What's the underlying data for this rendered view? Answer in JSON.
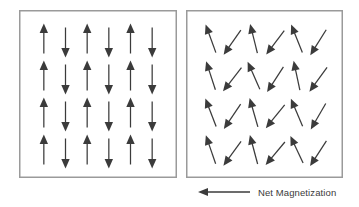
{
  "figure": {
    "background_color": "#ffffff",
    "arrow_color": "#3b3b3b",
    "border_color": "#9a9a9a"
  },
  "panels": [
    {
      "id": "ordered-box",
      "name": "antiferromagnetic-ordered-panel",
      "description": "Left panel: vertical spins alternating up and down",
      "columns": 6,
      "rows": 4,
      "box": {
        "x": 19,
        "y": 10,
        "width": 158,
        "height": 168
      },
      "arrow_length": 30,
      "arrows": [
        {
          "col": 0,
          "row": 0,
          "direction": "up",
          "angle_deg": 0
        },
        {
          "col": 1,
          "row": 0,
          "direction": "down",
          "angle_deg": 180
        },
        {
          "col": 2,
          "row": 0,
          "direction": "up",
          "angle_deg": 0
        },
        {
          "col": 3,
          "row": 0,
          "direction": "down",
          "angle_deg": 180
        },
        {
          "col": 4,
          "row": 0,
          "direction": "up",
          "angle_deg": 0
        },
        {
          "col": 5,
          "row": 0,
          "direction": "down",
          "angle_deg": 180
        },
        {
          "col": 0,
          "row": 1,
          "direction": "up",
          "angle_deg": 0
        },
        {
          "col": 1,
          "row": 1,
          "direction": "down",
          "angle_deg": 180
        },
        {
          "col": 2,
          "row": 1,
          "direction": "up",
          "angle_deg": 0
        },
        {
          "col": 3,
          "row": 1,
          "direction": "down",
          "angle_deg": 180
        },
        {
          "col": 4,
          "row": 1,
          "direction": "up",
          "angle_deg": 0
        },
        {
          "col": 5,
          "row": 1,
          "direction": "down",
          "angle_deg": 180
        },
        {
          "col": 0,
          "row": 2,
          "direction": "up",
          "angle_deg": 0
        },
        {
          "col": 1,
          "row": 2,
          "direction": "down",
          "angle_deg": 180
        },
        {
          "col": 2,
          "row": 2,
          "direction": "up",
          "angle_deg": 0
        },
        {
          "col": 3,
          "row": 2,
          "direction": "down",
          "angle_deg": 180
        },
        {
          "col": 4,
          "row": 2,
          "direction": "up",
          "angle_deg": 0
        },
        {
          "col": 5,
          "row": 2,
          "direction": "down",
          "angle_deg": 180
        },
        {
          "col": 0,
          "row": 3,
          "direction": "up",
          "angle_deg": 0
        },
        {
          "col": 1,
          "row": 3,
          "direction": "down",
          "angle_deg": 180
        },
        {
          "col": 2,
          "row": 3,
          "direction": "up",
          "angle_deg": 0
        },
        {
          "col": 3,
          "row": 3,
          "direction": "down",
          "angle_deg": 180
        },
        {
          "col": 4,
          "row": 3,
          "direction": "up",
          "angle_deg": 0
        },
        {
          "col": 5,
          "row": 3,
          "direction": "down",
          "angle_deg": 180
        }
      ]
    },
    {
      "id": "disordered-box",
      "name": "canted-spin-panel",
      "description": "Right panel: spins canted, up-arrows tilted left, down-arrows tilted right",
      "columns": 6,
      "rows": 4,
      "box": {
        "x": 186,
        "y": 10,
        "width": 157,
        "height": 168
      },
      "arrow_length": 30,
      "arrows": [
        {
          "col": 0,
          "row": 0,
          "direction": "up",
          "angle_deg": -20
        },
        {
          "col": 1,
          "row": 0,
          "direction": "down",
          "angle_deg": 215
        },
        {
          "col": 2,
          "row": 0,
          "direction": "up",
          "angle_deg": -14
        },
        {
          "col": 3,
          "row": 0,
          "direction": "down",
          "angle_deg": 217
        },
        {
          "col": 4,
          "row": 0,
          "direction": "up",
          "angle_deg": -22
        },
        {
          "col": 5,
          "row": 0,
          "direction": "down",
          "angle_deg": 212
        },
        {
          "col": 0,
          "row": 1,
          "direction": "up",
          "angle_deg": -18
        },
        {
          "col": 1,
          "row": 1,
          "direction": "down",
          "angle_deg": 218
        },
        {
          "col": 2,
          "row": 1,
          "direction": "up",
          "angle_deg": -24
        },
        {
          "col": 3,
          "row": 1,
          "direction": "down",
          "angle_deg": 213
        },
        {
          "col": 4,
          "row": 1,
          "direction": "up",
          "angle_deg": -12
        },
        {
          "col": 5,
          "row": 1,
          "direction": "down",
          "angle_deg": 216
        },
        {
          "col": 0,
          "row": 2,
          "direction": "up",
          "angle_deg": -21
        },
        {
          "col": 1,
          "row": 2,
          "direction": "down",
          "angle_deg": 214
        },
        {
          "col": 2,
          "row": 2,
          "direction": "up",
          "angle_deg": -16
        },
        {
          "col": 3,
          "row": 2,
          "direction": "down",
          "angle_deg": 219
        },
        {
          "col": 4,
          "row": 2,
          "direction": "up",
          "angle_deg": -23
        },
        {
          "col": 5,
          "row": 2,
          "direction": "down",
          "angle_deg": 210
        },
        {
          "col": 0,
          "row": 3,
          "direction": "up",
          "angle_deg": -19
        },
        {
          "col": 1,
          "row": 3,
          "direction": "down",
          "angle_deg": 216
        },
        {
          "col": 2,
          "row": 3,
          "direction": "up",
          "angle_deg": -15
        },
        {
          "col": 3,
          "row": 3,
          "direction": "down",
          "angle_deg": 220
        },
        {
          "col": 4,
          "row": 3,
          "direction": "up",
          "angle_deg": -25
        },
        {
          "col": 5,
          "row": 3,
          "direction": "down",
          "angle_deg": 213
        }
      ]
    }
  ],
  "legend": {
    "name": "net-magnetization-legend",
    "label": "Net Magnetization",
    "arrow_direction": "left",
    "arrow_color": "#3b3b3b",
    "text_color": "#3a3a3a"
  }
}
